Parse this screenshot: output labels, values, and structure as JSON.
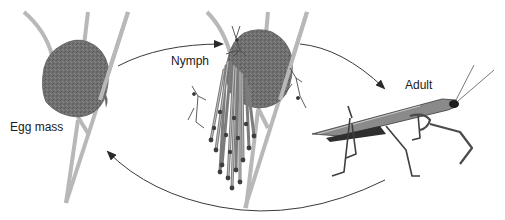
{
  "diagram": {
    "stages": [
      {
        "id": "egg-mass",
        "label": "Egg mass"
      },
      {
        "id": "nymph",
        "label": "Nymph"
      },
      {
        "id": "adult",
        "label": "Adult"
      }
    ],
    "transitions": [
      {
        "from": "egg-mass",
        "to": "nymph"
      },
      {
        "from": "nymph",
        "to": "adult"
      },
      {
        "from": "adult",
        "to": "egg-mass"
      }
    ],
    "colors": {
      "stem": "#b3b3b3",
      "egg_mass": "#6e6e6e",
      "arrow": "#3a3a3a",
      "insect": "#4a4a4a",
      "background": "#ffffff"
    }
  }
}
